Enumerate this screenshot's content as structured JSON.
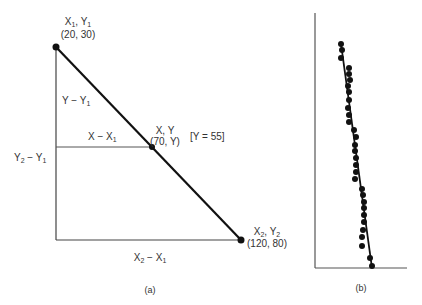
{
  "panel_a": {
    "caption": "(a)",
    "point1": {
      "label_x": "X",
      "sub_x": "1",
      "label_y": "Y",
      "sub_y": "1",
      "coords": "(20, 30)",
      "px": [
        56,
        47
      ]
    },
    "point_mid": {
      "label": "X, Y",
      "coords": "(70, Y)",
      "note": "[Y = 55]",
      "px": [
        152,
        147
      ]
    },
    "point2": {
      "label_x": "X",
      "sub_x": "2",
      "label_y": "Y",
      "sub_y": "2",
      "coords": "(120, 80)",
      "px": [
        241,
        240
      ]
    },
    "labels": {
      "y_minus_y1": {
        "main": "Y − Y",
        "sub": "1"
      },
      "x_minus_x1": {
        "main": "X − X",
        "sub": "1"
      },
      "y2_minus_y1": {
        "a": "Y",
        "a_sub": "2",
        "b": " − Y",
        "b_sub": "1"
      },
      "x2_minus_x1": {
        "a": "X",
        "a_sub": "2",
        "b": " − X",
        "b_sub": "1"
      }
    }
  },
  "panel_b": {
    "caption": "(b)",
    "axes": {
      "x0": 315,
      "y_top": 13,
      "y_bottom": 268,
      "x_right": 407
    },
    "fit_line": {
      "from": [
        341,
        44
      ],
      "to": [
        372,
        268
      ]
    },
    "dots": [
      [
        341,
        44
      ],
      [
        342,
        50
      ],
      [
        341,
        58
      ],
      [
        349,
        68
      ],
      [
        349,
        74
      ],
      [
        350,
        80
      ],
      [
        348,
        86
      ],
      [
        349,
        92
      ],
      [
        349,
        100
      ],
      [
        348,
        108
      ],
      [
        349,
        115
      ],
      [
        349,
        122
      ],
      [
        354,
        130
      ],
      [
        356,
        137
      ],
      [
        355,
        145
      ],
      [
        355,
        151
      ],
      [
        356,
        158
      ],
      [
        356,
        165
      ],
      [
        356,
        172
      ],
      [
        355,
        179
      ],
      [
        362,
        189
      ],
      [
        363,
        195
      ],
      [
        364,
        202
      ],
      [
        364,
        208
      ],
      [
        364,
        215
      ],
      [
        364,
        222
      ],
      [
        363,
        230
      ],
      [
        362,
        237
      ],
      [
        362,
        246
      ],
      [
        370,
        258
      ],
      [
        372,
        266
      ]
    ]
  }
}
